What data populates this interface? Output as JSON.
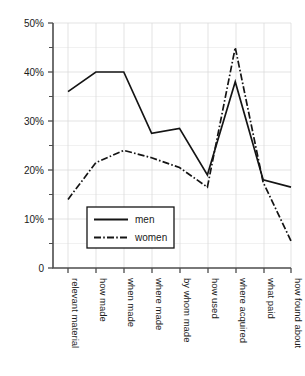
{
  "chart_data": {
    "type": "line",
    "title": "",
    "subtitle": "",
    "xlabel": "",
    "ylabel": "",
    "categories": [
      "relevant material",
      "how made",
      "when made",
      "where made",
      "by whom made",
      "how used",
      "where acquired",
      "what paid",
      "how found about"
    ],
    "series": [
      {
        "name": "men",
        "style": "solid",
        "color": "#141414",
        "values": [
          36,
          40,
          40,
          27.5,
          28.5,
          19,
          38,
          18,
          16.5
        ]
      },
      {
        "name": "women",
        "style": "dash-dot",
        "color": "#141414",
        "values": [
          14,
          21.5,
          24,
          22.5,
          20.5,
          16.5,
          45,
          17.5,
          5.5
        ]
      }
    ],
    "ylim": [
      0,
      50
    ],
    "y_major_ticks": [
      0,
      10,
      20,
      30,
      40,
      50
    ],
    "y_minor_ticks": [
      5,
      15,
      25,
      35,
      45
    ],
    "y_tick_labels": [
      "0",
      "10%",
      "20%",
      "30%",
      "40%",
      "50%"
    ],
    "grid": true,
    "grid_axis": "both",
    "legend_position": "inside-lower-center",
    "legend_entries": [
      "men",
      "women"
    ],
    "x_tick_label_rotation": -90
  },
  "axis": {
    "y_labels": [
      "50%",
      "40%",
      "30%",
      "20%",
      "10%",
      "0"
    ]
  },
  "legend": {
    "men_label": "men",
    "women_label": "women"
  }
}
